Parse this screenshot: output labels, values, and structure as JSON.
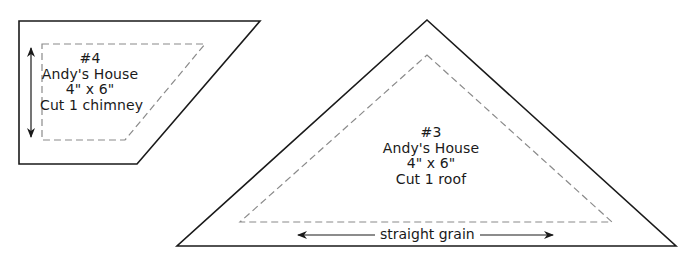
{
  "pieces": [
    {
      "number": "#4",
      "project": "Andy's House",
      "size": "4\" x 6\"",
      "instruction": "Cut 1 chimney",
      "shape": "parallelogram"
    },
    {
      "number": "#3",
      "project": "Andy's House",
      "size": "4\" x 6\"",
      "instruction": "Cut 1 roof",
      "shape": "triangle",
      "grain_label": "straight grain"
    }
  ],
  "colors": {
    "outline": "#1a1a1a",
    "seam_dash": "#8a8a8a",
    "background": "#ffffff"
  }
}
